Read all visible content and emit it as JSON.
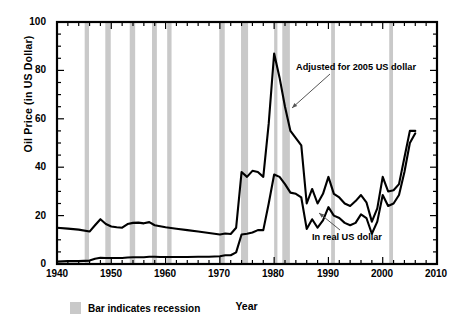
{
  "chart_data": {
    "type": "line",
    "title": "",
    "xlabel": "Year",
    "ylabel": "Oil Price (in US Dollar)",
    "xlim": [
      1940,
      2010
    ],
    "ylim": [
      0,
      100
    ],
    "xticks": [
      1940,
      1950,
      1960,
      1970,
      1980,
      1990,
      2000,
      2010
    ],
    "yticks": [
      0,
      20,
      40,
      60,
      80,
      100
    ],
    "grid": false,
    "legend_position": "below-axes",
    "legend_entries": [
      {
        "label": "Bar indicates recession",
        "color": "#c9c9c9",
        "type": "band"
      }
    ],
    "annotations": [
      {
        "text": "Adjusted for 2005 US dollar",
        "points_to_series": "Adjusted for 2005 US dollar",
        "x": 1986.5,
        "y": 72
      },
      {
        "text": "In real US dollar",
        "points_to_series": "In real US dollar",
        "x": 1991.5,
        "y": 9
      }
    ],
    "series": [
      {
        "name": "Adjusted for 2005 US dollar",
        "color": "#000000",
        "x": [
          1940,
          1942,
          1944,
          1946,
          1947,
          1948,
          1949,
          1950,
          1951,
          1952,
          1953,
          1954,
          1955,
          1956,
          1957,
          1958,
          1959,
          1960,
          1962,
          1964,
          1966,
          1968,
          1970,
          1971,
          1972,
          1973,
          1974,
          1975,
          1976,
          1977,
          1978,
          1979,
          1980,
          1981,
          1982,
          1983,
          1984,
          1985,
          1986,
          1987,
          1988,
          1989,
          1990,
          1991,
          1992,
          1993,
          1994,
          1995,
          1996,
          1997,
          1998,
          1999,
          2000,
          2001,
          2002,
          2003,
          2004,
          2005,
          2006
        ],
        "y": [
          15.0,
          14.6,
          14.2,
          13.4,
          16.0,
          18.5,
          16.5,
          15.5,
          15.2,
          15.0,
          16.5,
          17.0,
          17.1,
          16.8,
          17.3,
          16.0,
          15.6,
          15.2,
          14.6,
          14.0,
          13.4,
          12.8,
          12.2,
          12.6,
          12.4,
          15.0,
          38.0,
          36.0,
          38.5,
          38.0,
          36.0,
          58.0,
          87.0,
          77.0,
          65.0,
          55.0,
          52.0,
          49.0,
          25.0,
          31.0,
          25.0,
          29.0,
          36.0,
          29.0,
          27.5,
          25.0,
          24.0,
          26.0,
          28.5,
          25.5,
          17.5,
          23.0,
          36.0,
          30.0,
          30.5,
          33.0,
          44.0,
          55.0,
          55.0
        ]
      },
      {
        "name": "In real US dollar",
        "color": "#000000",
        "x": [
          1940,
          1942,
          1944,
          1946,
          1947,
          1948,
          1949,
          1950,
          1951,
          1952,
          1953,
          1954,
          1955,
          1956,
          1957,
          1958,
          1959,
          1960,
          1962,
          1964,
          1966,
          1968,
          1970,
          1971,
          1972,
          1973,
          1974,
          1975,
          1976,
          1977,
          1978,
          1979,
          1980,
          1981,
          1982,
          1983,
          1984,
          1985,
          1986,
          1987,
          1988,
          1989,
          1990,
          1991,
          1992,
          1993,
          1994,
          1995,
          1996,
          1997,
          1998,
          1999,
          2000,
          2001,
          2002,
          2003,
          2004,
          2005,
          2006
        ],
        "y": [
          1.0,
          1.2,
          1.2,
          1.4,
          2.2,
          2.6,
          2.5,
          2.5,
          2.5,
          2.5,
          2.7,
          2.8,
          2.8,
          2.8,
          3.0,
          3.0,
          2.9,
          2.9,
          2.9,
          2.9,
          3.0,
          3.0,
          3.2,
          3.6,
          3.6,
          4.8,
          12.2,
          12.5,
          13.0,
          14.0,
          14.0,
          25.0,
          37.0,
          36.0,
          33.0,
          29.5,
          29.0,
          27.5,
          14.5,
          18.5,
          15.0,
          18.0,
          23.5,
          20.0,
          19.0,
          17.0,
          16.0,
          17.0,
          20.5,
          19.0,
          12.5,
          17.5,
          28.5,
          24.0,
          25.0,
          28.5,
          38.0,
          50.0,
          54.0
        ]
      }
    ],
    "recession_bands": [
      {
        "start": 1945.1,
        "end": 1945.9
      },
      {
        "start": 1948.9,
        "end": 1949.9
      },
      {
        "start": 1953.4,
        "end": 1954.4
      },
      {
        "start": 1957.5,
        "end": 1958.4
      },
      {
        "start": 1960.3,
        "end": 1961.1
      },
      {
        "start": 1969.9,
        "end": 1970.9
      },
      {
        "start": 1973.9,
        "end": 1975.2
      },
      {
        "start": 1980.0,
        "end": 1980.6
      },
      {
        "start": 1981.5,
        "end": 1982.9
      },
      {
        "start": 1990.5,
        "end": 1991.2
      },
      {
        "start": 2001.2,
        "end": 2001.9
      }
    ]
  }
}
